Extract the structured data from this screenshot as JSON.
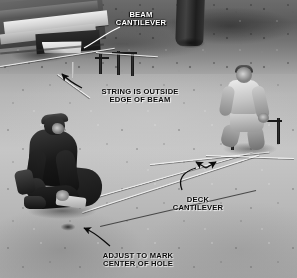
{
  "image": {
    "kind": "instructional-photograph",
    "subject": "deck-layout-string-and-footing-marking",
    "palette": "black-and-white",
    "width": 297,
    "height": 278,
    "colors": {
      "label_white": "#ffffff",
      "label_black": "#0b0b0b",
      "leader_line": "#0b0b0b",
      "string_line": "#faf9f6",
      "ground_light": "#c9c6bf",
      "ground_dark": "#5b5853"
    }
  },
  "annotations": [
    {
      "id": "beam-cantilever",
      "text": "BEAM\nCANTILEVER",
      "color": "white",
      "font_size_px": 7.6,
      "x": 141,
      "y": 11,
      "leader": "curve down-left to beam end"
    },
    {
      "id": "string-is-outside-edge-of-beam",
      "text": "STRING IS OUTSIDE\nEDGE OF BEAM",
      "color": "black",
      "font_size_px": 7.6,
      "x": 140,
      "y": 88,
      "leader": "curve up-left with arrowhead at string"
    },
    {
      "id": "deck-cantilever",
      "text": "DECK\nCANTILEVER",
      "color": "black",
      "font_size_px": 7.6,
      "x": 198,
      "y": 196,
      "leader": "curve up-right to double arrowheads on string"
    },
    {
      "id": "adjust-to-mark-center-of-hole",
      "text": "ADJUST TO MARK\nCENTER OF HOLE",
      "color": "black",
      "font_size_px": 7.6,
      "x": 138,
      "y": 252,
      "leader": "curve up-left with arrowhead at marked hole"
    }
  ],
  "scene": {
    "structures": [
      {
        "name": "deck-beam-assembly",
        "location": "upper-left"
      },
      {
        "name": "tree-trunk",
        "location": "upper-center-right"
      },
      {
        "name": "batter-board-stakes",
        "location": "upper-center"
      },
      {
        "name": "string-lines",
        "location": "across-ground"
      }
    ],
    "people": [
      {
        "name": "worker-kneeling-dark-shirt",
        "location": "left-center",
        "action": "marking footing hole"
      },
      {
        "name": "worker-kneeling-light-shirt",
        "location": "right",
        "action": "holding string line"
      }
    ]
  }
}
